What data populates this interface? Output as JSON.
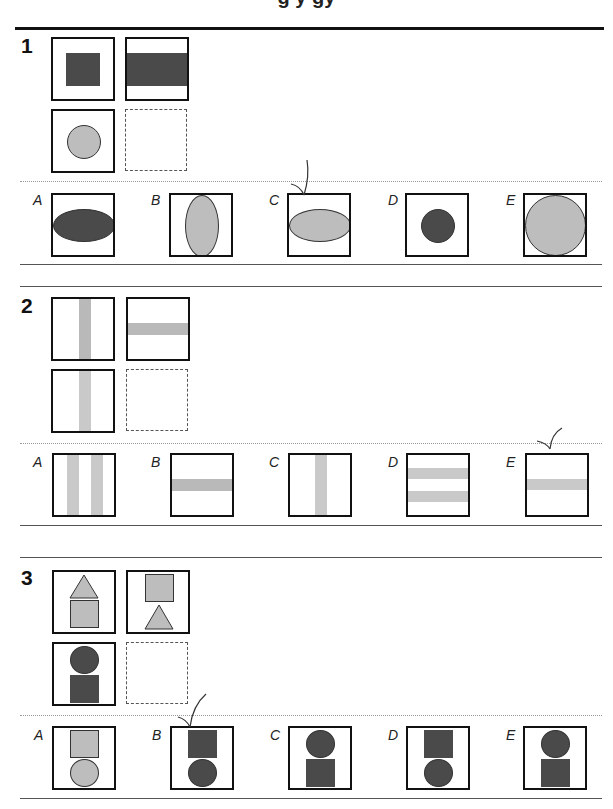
{
  "page": {
    "title_fragment": "g y   gy",
    "colors": {
      "dark_fill": "#4a4a4a",
      "light_fill": "#bdbdbd",
      "bar_fill": "#c9c9c9",
      "border": "#111111"
    }
  },
  "questions": [
    {
      "number": "1",
      "matrix": [
        {
          "cell": "top-left",
          "content": "dark square inside frame"
        },
        {
          "cell": "top-right",
          "content": "dark horizontal band spanning width"
        },
        {
          "cell": "bottom-left",
          "content": "light circle inside frame"
        },
        {
          "cell": "bottom-right",
          "content": "empty (answer slot)"
        }
      ],
      "options": [
        {
          "label": "A",
          "content": "dark horizontal ellipse"
        },
        {
          "label": "B",
          "content": "light vertical ellipse"
        },
        {
          "label": "C",
          "content": "light horizontal ellipse",
          "marked": true
        },
        {
          "label": "D",
          "content": "small dark circle"
        },
        {
          "label": "E",
          "content": "large light circle filling frame"
        }
      ]
    },
    {
      "number": "2",
      "matrix": [
        {
          "cell": "top-left",
          "content": "vertical grey bar"
        },
        {
          "cell": "top-right",
          "content": "horizontal grey bar"
        },
        {
          "cell": "bottom-left",
          "content": "vertical light bar"
        },
        {
          "cell": "bottom-right",
          "content": "empty (answer slot)"
        }
      ],
      "options": [
        {
          "label": "A",
          "content": "two vertical light bars"
        },
        {
          "label": "B",
          "content": "horizontal grey bar"
        },
        {
          "label": "C",
          "content": "vertical light bar"
        },
        {
          "label": "D",
          "content": "two horizontal light bars"
        },
        {
          "label": "E",
          "content": "horizontal light bar",
          "marked": true
        }
      ]
    },
    {
      "number": "3",
      "matrix": [
        {
          "cell": "top-left",
          "content": "light triangle over light square"
        },
        {
          "cell": "top-right",
          "content": "light square over light triangle"
        },
        {
          "cell": "bottom-left",
          "content": "dark circle over dark square"
        },
        {
          "cell": "bottom-right",
          "content": "empty (answer slot)"
        }
      ],
      "options": [
        {
          "label": "A",
          "content": "light square over light circle"
        },
        {
          "label": "B",
          "content": "dark square over dark circle",
          "marked": true
        },
        {
          "label": "C",
          "content": "dark circle over dark square"
        },
        {
          "label": "D",
          "content": "dark square over dark circle"
        },
        {
          "label": "E",
          "content": "dark circle over dark square"
        }
      ]
    }
  ]
}
